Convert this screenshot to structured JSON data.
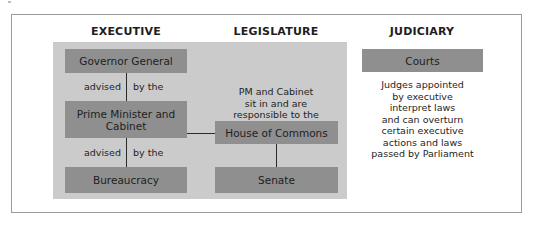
{
  "columns": {
    "executive": "EXECUTIVE",
    "legislature": "LEGISLATURE",
    "judiciary": "JUDICIARY"
  },
  "executive": {
    "governor_general": "Governor General",
    "advised_1_left": "advised",
    "advised_1_right": "by the",
    "pm_cabinet_line1": "Prime Minister and",
    "pm_cabinet_line2": "Cabinet",
    "advised_2_left": "advised",
    "advised_2_right": "by the",
    "bureaucracy": "Bureaucracy"
  },
  "legislature": {
    "note_line1": "PM and Cabinet",
    "note_line2": "sit in and are",
    "note_line3": "responsible to the",
    "house_of_commons": "House of Commons",
    "senate": "Senate"
  },
  "judiciary": {
    "courts": "Courts",
    "note_lines": [
      "Judges appointed",
      "by executive",
      "interpret laws",
      "and can overturn",
      "certain executive",
      "actions and laws",
      "passed by Parliament"
    ]
  },
  "colors": {
    "box_fill": "#8f8f8f",
    "panel_fill": "#cbcbcb",
    "frame_border": "#9a9a9a"
  }
}
